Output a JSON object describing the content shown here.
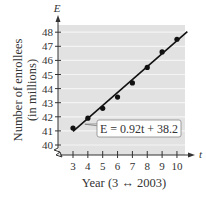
{
  "chart_data": {
    "type": "scatter",
    "title": "",
    "xlabel": "Year (3 ↔ 2003)",
    "ylabel": "Number of enrollees (in millions)",
    "ylabel_lines": [
      "Number of enrollees",
      "(in millions)"
    ],
    "x_axis_name": "t",
    "y_axis_name": "E",
    "x": [
      3,
      4,
      5,
      6,
      7,
      8,
      9,
      10
    ],
    "series": [
      {
        "name": "Enrollees",
        "values": [
          41.2,
          41.9,
          42.6,
          43.4,
          44.4,
          45.5,
          46.6,
          47.5
        ]
      }
    ],
    "fit_line": {
      "equation": "E = 0.92t + 38.2",
      "slope": 0.92,
      "intercept": 38.2,
      "x_range": [
        3,
        10.7
      ]
    },
    "x_ticks": [
      3,
      4,
      5,
      6,
      7,
      8,
      9,
      10
    ],
    "y_ticks": [
      40,
      41,
      42,
      43,
      44,
      45,
      46,
      47,
      48
    ],
    "xlim": [
      2.7,
      10.8
    ],
    "ylim": [
      39.3,
      48.5
    ],
    "grid": true,
    "y_axis_break": true,
    "legend": null,
    "colors": {
      "plot_bg": "#e2e2e2",
      "grid": "#f4f4f4",
      "line": "#111111",
      "point": "#111111"
    }
  }
}
